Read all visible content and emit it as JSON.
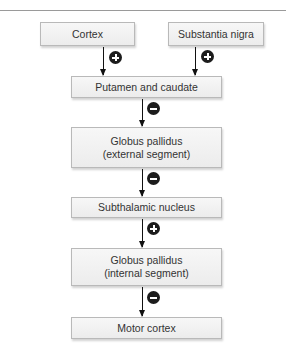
{
  "diagram": {
    "type": "flowchart",
    "nodes": [
      {
        "id": "cortex",
        "lines": [
          "Cortex"
        ]
      },
      {
        "id": "substantia_nigra",
        "lines": [
          "Substantia nigra"
        ]
      },
      {
        "id": "putamen_caudate",
        "lines": [
          "Putamen and caudate"
        ]
      },
      {
        "id": "gp_external",
        "lines": [
          "Globus pallidus",
          "(external segment)"
        ]
      },
      {
        "id": "subthalamic",
        "lines": [
          "Subthalamic nucleus"
        ]
      },
      {
        "id": "gp_internal",
        "lines": [
          "Globus pallidus",
          "(internal segment)"
        ]
      },
      {
        "id": "motor_cortex",
        "lines": [
          "Motor cortex"
        ]
      }
    ],
    "edges": [
      {
        "from": "cortex",
        "to": "putamen_caudate",
        "sign": "+",
        "icon": "plus-circle-icon"
      },
      {
        "from": "substantia_nigra",
        "to": "putamen_caudate",
        "sign": "+",
        "icon": "plus-circle-icon"
      },
      {
        "from": "putamen_caudate",
        "to": "gp_external",
        "sign": "-",
        "icon": "minus-circle-icon"
      },
      {
        "from": "gp_external",
        "to": "subthalamic",
        "sign": "-",
        "icon": "minus-circle-icon"
      },
      {
        "from": "subthalamic",
        "to": "gp_internal",
        "sign": "+",
        "icon": "plus-circle-icon"
      },
      {
        "from": "gp_internal",
        "to": "motor_cortex",
        "sign": "-",
        "icon": "minus-circle-icon"
      }
    ]
  },
  "colors": {
    "box_fill": "#f2f2f2",
    "box_border": "#b9b9b9",
    "arrow": "#111111",
    "sign_fill": "#1c1c1c"
  }
}
